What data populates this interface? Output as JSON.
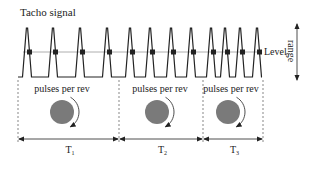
{
  "diagram": {
    "title": "Tacho signal",
    "level_label": "Level",
    "range_label": "range",
    "colors": {
      "signal": "#222222",
      "level_line": "#9a9a9a",
      "disk": "#7a7a7a",
      "dashed": "#555555"
    },
    "signal": {
      "baseline_y": 77,
      "peak_y": 28,
      "level_y": 52,
      "start_x": 18,
      "end_x": 262,
      "pulse_peaks_x": [
        27,
        53,
        80,
        107,
        130,
        150,
        171,
        191,
        211,
        225,
        240,
        257
      ]
    },
    "segments": [
      {
        "label": "T",
        "subscript": "1",
        "caption": "pulses per rev",
        "x0": 18,
        "x1": 119,
        "disk_cx": 62
      },
      {
        "label": "T",
        "subscript": "2",
        "caption": "pulses per rev",
        "x0": 119,
        "x1": 203,
        "disk_cx": 157
      },
      {
        "label": "T",
        "subscript": "3",
        "caption": "pulses per rev",
        "x0": 203,
        "x1": 263,
        "disk_cx": 228
      }
    ]
  }
}
